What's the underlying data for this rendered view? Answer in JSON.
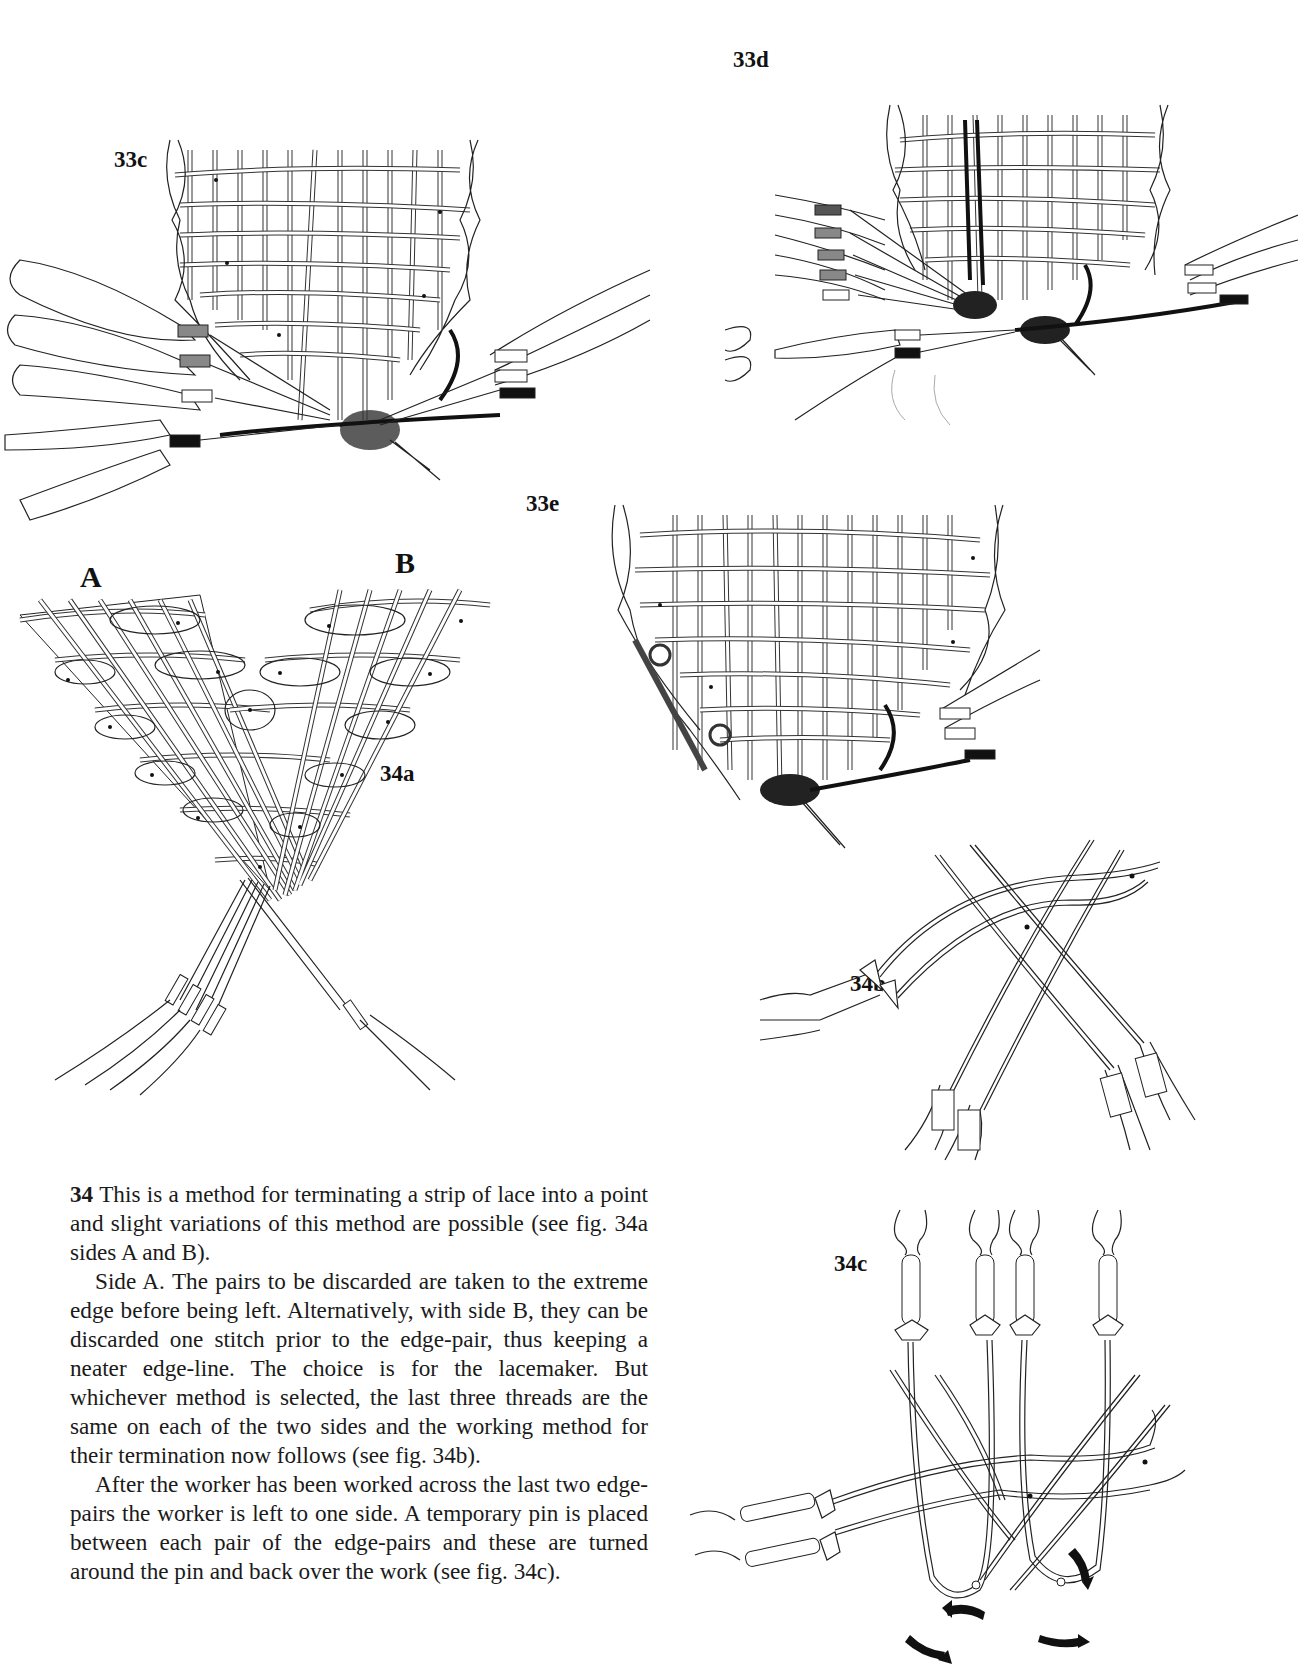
{
  "figures": {
    "fig33c": {
      "label": "33c"
    },
    "fig33d": {
      "label": "33d"
    },
    "fig33e": {
      "label": "33e"
    },
    "fig34a": {
      "label": "34a",
      "side_a": "A",
      "side_b": "B"
    },
    "fig34b": {
      "label": "34b"
    },
    "fig34c": {
      "label": "34c"
    }
  },
  "text": {
    "paragraph1": {
      "number": "34",
      "body": "This is a method for terminating a strip of lace into a point and slight variations of this method are possible (see fig. 34a sides A and B)."
    },
    "paragraph2": "Side A. The pairs to be discarded are taken to the extreme edge before being left. Alternatively, with side B, they can be discarded one stitch prior to the edge-pair, thus keeping a neater edge-line. The choice is for the lacemaker. But whichever method is selected, the last three threads are the same on each of the two sides and the working method for their termination now follows (see fig. 34b).",
    "paragraph3": "After the worker has been worked across the last two edge-pairs the worker is left to one side. A temporary pin is placed between each pair of the edge-pairs and these are turned around the pin and back over the work (see fig. 34c)."
  }
}
